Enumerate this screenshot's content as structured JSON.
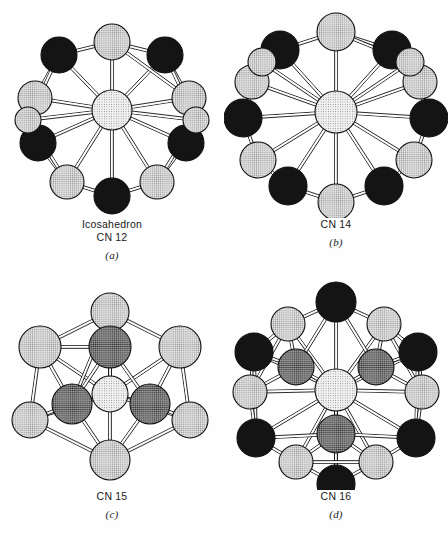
{
  "figure": {
    "background_color": "#fefefe",
    "line_color": "#111111",
    "panel_count": 4
  },
  "palette": {
    "dark_sphere": "#141414",
    "light_sphere": "#d9d9d9",
    "medium_sphere": "#8c8c8c",
    "center_sphere": "#ebebeb",
    "outline": "#111111"
  },
  "panels": [
    {
      "id": "a",
      "name": "Icosahedron",
      "cn_label": "CN 12",
      "letter": "(a)",
      "coordination_number": 12,
      "center_atom": {
        "cx": 112,
        "cy": 110,
        "r": 20,
        "shade": "center"
      },
      "vertices": [
        {
          "cx": 112,
          "cy": 42,
          "r": 18,
          "shade": "light"
        },
        {
          "cx": 165,
          "cy": 55,
          "r": 18,
          "shade": "dark"
        },
        {
          "cx": 59,
          "cy": 55,
          "r": 18,
          "shade": "dark"
        },
        {
          "cx": 189,
          "cy": 98,
          "r": 17,
          "shade": "light"
        },
        {
          "cx": 35,
          "cy": 98,
          "r": 17,
          "shade": "light"
        },
        {
          "cx": 186,
          "cy": 143,
          "r": 18,
          "shade": "dark"
        },
        {
          "cx": 38,
          "cy": 143,
          "r": 18,
          "shade": "dark"
        },
        {
          "cx": 157,
          "cy": 182,
          "r": 17,
          "shade": "light"
        },
        {
          "cx": 67,
          "cy": 182,
          "r": 17,
          "shade": "light"
        },
        {
          "cx": 112,
          "cy": 196,
          "r": 18,
          "shade": "dark"
        },
        {
          "cx": 196,
          "cy": 120,
          "r": 13,
          "shade": "light"
        },
        {
          "cx": 28,
          "cy": 120,
          "r": 13,
          "shade": "light"
        }
      ]
    },
    {
      "id": "b",
      "name": "",
      "cn_label": "CN 14",
      "letter": "(b)",
      "coordination_number": 14,
      "center_atom": {
        "cx": 112,
        "cy": 112,
        "r": 21,
        "shade": "center"
      },
      "vertices": [
        {
          "cx": 112,
          "cy": 32,
          "r": 19,
          "shade": "light"
        },
        {
          "cx": 168,
          "cy": 50,
          "r": 19,
          "shade": "dark"
        },
        {
          "cx": 56,
          "cy": 50,
          "r": 19,
          "shade": "dark"
        },
        {
          "cx": 196,
          "cy": 82,
          "r": 17,
          "shade": "light"
        },
        {
          "cx": 28,
          "cy": 82,
          "r": 17,
          "shade": "light"
        },
        {
          "cx": 205,
          "cy": 118,
          "r": 19,
          "shade": "dark"
        },
        {
          "cx": 19,
          "cy": 118,
          "r": 19,
          "shade": "dark"
        },
        {
          "cx": 190,
          "cy": 160,
          "r": 18,
          "shade": "light"
        },
        {
          "cx": 34,
          "cy": 160,
          "r": 18,
          "shade": "light"
        },
        {
          "cx": 160,
          "cy": 186,
          "r": 19,
          "shade": "dark"
        },
        {
          "cx": 64,
          "cy": 186,
          "r": 19,
          "shade": "dark"
        },
        {
          "cx": 112,
          "cy": 202,
          "r": 18,
          "shade": "light"
        },
        {
          "cx": 186,
          "cy": 62,
          "r": 14,
          "shade": "light"
        },
        {
          "cx": 38,
          "cy": 62,
          "r": 14,
          "shade": "light"
        }
      ]
    },
    {
      "id": "c",
      "name": "",
      "cn_label": "CN 15",
      "letter": "(c)",
      "coordination_number": 15,
      "center_atom": {
        "cx": 110,
        "cy": 122,
        "r": 18,
        "shade": "center"
      },
      "vertices": [
        {
          "cx": 110,
          "cy": 40,
          "r": 19,
          "shade": "light"
        },
        {
          "cx": 110,
          "cy": 75,
          "r": 21,
          "shade": "medium"
        },
        {
          "cx": 40,
          "cy": 75,
          "r": 21,
          "shade": "light"
        },
        {
          "cx": 180,
          "cy": 75,
          "r": 21,
          "shade": "light"
        },
        {
          "cx": 72,
          "cy": 132,
          "r": 20,
          "shade": "medium"
        },
        {
          "cx": 150,
          "cy": 132,
          "r": 20,
          "shade": "medium"
        },
        {
          "cx": 30,
          "cy": 148,
          "r": 18,
          "shade": "light"
        },
        {
          "cx": 190,
          "cy": 148,
          "r": 18,
          "shade": "light"
        },
        {
          "cx": 110,
          "cy": 188,
          "r": 20,
          "shade": "light"
        }
      ]
    },
    {
      "id": "d",
      "name": "",
      "cn_label": "CN 16",
      "letter": "(d)",
      "coordination_number": 16,
      "center_atom": {
        "cx": 112,
        "cy": 118,
        "r": 21,
        "shade": "center"
      },
      "vertices": [
        {
          "cx": 112,
          "cy": 30,
          "r": 20,
          "shade": "dark"
        },
        {
          "cx": 64,
          "cy": 52,
          "r": 17,
          "shade": "light"
        },
        {
          "cx": 160,
          "cy": 52,
          "r": 17,
          "shade": "light"
        },
        {
          "cx": 30,
          "cy": 80,
          "r": 19,
          "shade": "dark"
        },
        {
          "cx": 194,
          "cy": 80,
          "r": 19,
          "shade": "dark"
        },
        {
          "cx": 72,
          "cy": 95,
          "r": 18,
          "shade": "medium"
        },
        {
          "cx": 152,
          "cy": 95,
          "r": 18,
          "shade": "medium"
        },
        {
          "cx": 26,
          "cy": 120,
          "r": 17,
          "shade": "light"
        },
        {
          "cx": 198,
          "cy": 120,
          "r": 17,
          "shade": "light"
        },
        {
          "cx": 32,
          "cy": 166,
          "r": 19,
          "shade": "dark"
        },
        {
          "cx": 192,
          "cy": 166,
          "r": 19,
          "shade": "dark"
        },
        {
          "cx": 112,
          "cy": 162,
          "r": 19,
          "shade": "medium"
        },
        {
          "cx": 72,
          "cy": 190,
          "r": 17,
          "shade": "light"
        },
        {
          "cx": 152,
          "cy": 190,
          "r": 17,
          "shade": "light"
        },
        {
          "cx": 112,
          "cy": 212,
          "r": 19,
          "shade": "dark"
        }
      ]
    }
  ]
}
